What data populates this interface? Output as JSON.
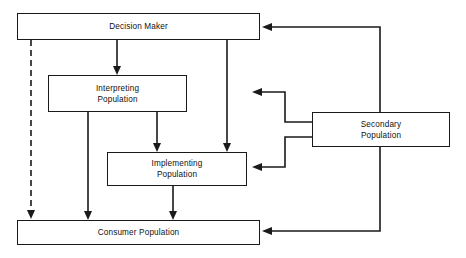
{
  "diagram": {
    "canvas": {
      "width": 466,
      "height": 258,
      "background": "#ffffff"
    },
    "line_color": "#1a1a1a",
    "nodes": [
      {
        "id": "decision-maker",
        "label": "Decision Maker",
        "x": 17,
        "y": 13,
        "width": 243,
        "height": 27
      },
      {
        "id": "interpreting-population",
        "label": "Interpreting\nPopulation",
        "x": 48,
        "y": 75,
        "width": 139,
        "height": 37
      },
      {
        "id": "implementing-population",
        "label": "Implementing\nPopulation",
        "x": 107,
        "y": 152,
        "width": 140,
        "height": 34
      },
      {
        "id": "consumer-population",
        "label": "Consumer Population",
        "x": 17,
        "y": 220,
        "width": 243,
        "height": 25
      },
      {
        "id": "secondary-population",
        "label": "Secondary\nPopulation",
        "x": 312,
        "y": 112,
        "width": 138,
        "height": 35
      }
    ],
    "edges": [
      {
        "id": "decision-to-consumer-dashed",
        "from": "decision-maker",
        "to": "consumer-population",
        "style": "dashed",
        "arrow": true
      },
      {
        "id": "decision-to-interpreting",
        "from": "decision-maker",
        "to": "interpreting-population",
        "style": "solid",
        "arrow": true
      },
      {
        "id": "decision-to-implementing",
        "from": "decision-maker",
        "to": "implementing-population",
        "style": "solid",
        "arrow": true
      },
      {
        "id": "interpreting-to-implementing",
        "from": "interpreting-population",
        "to": "implementing-population",
        "style": "solid",
        "arrow": true
      },
      {
        "id": "interpreting-to-consumer",
        "from": "interpreting-population",
        "to": "consumer-population",
        "style": "solid",
        "arrow": true
      },
      {
        "id": "implementing-to-consumer",
        "from": "implementing-population",
        "to": "consumer-population",
        "style": "solid",
        "arrow": true
      },
      {
        "id": "secondary-to-decision",
        "from": "secondary-population",
        "to": "decision-maker",
        "style": "solid",
        "arrow": true
      },
      {
        "id": "secondary-to-interpreting",
        "from": "secondary-population",
        "to": "interpreting-population",
        "style": "solid",
        "arrow": true
      },
      {
        "id": "secondary-to-implementing",
        "from": "secondary-population",
        "to": "implementing-population",
        "style": "solid",
        "arrow": true
      },
      {
        "id": "secondary-to-consumer",
        "from": "secondary-population",
        "to": "consumer-population",
        "style": "solid",
        "arrow": true
      }
    ]
  }
}
